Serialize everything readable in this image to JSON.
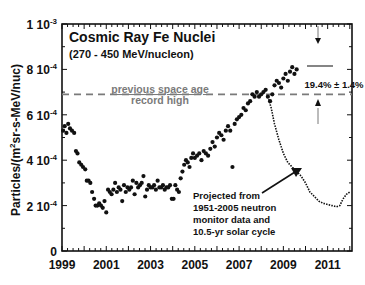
{
  "chart_data": {
    "type": "scatter",
    "title": "Cosmic Ray Fe Nuclei",
    "subtitle": "(270 - 450 MeV/nucleon)",
    "xlabel": "",
    "ylabel": "Particles/(m2sr-s-MeV/nuc)",
    "ylabel_parts": {
      "prefix": "Particles/(m",
      "sup": "2",
      "suffix": "sr-s-MeV/nuc)"
    },
    "xlim": [
      1999,
      2012.1
    ],
    "ylim": [
      0,
      0.001
    ],
    "x_ticks": [
      "1999",
      "2001",
      "2003",
      "2005",
      "2007",
      "2009",
      "2011"
    ],
    "y_ticks": [
      {
        "mant": "0",
        "exp": "",
        "value": 0
      },
      {
        "mant": "2 10",
        "exp": "-4",
        "value": 2
      },
      {
        "mant": "4 10",
        "exp": "-4",
        "value": 4
      },
      {
        "mant": "6 10",
        "exp": "-4",
        "value": 6
      },
      {
        "mant": "8 10",
        "exp": "-4",
        "value": 8
      },
      {
        "mant": "1 10",
        "exp": "-3",
        "value": 10
      }
    ],
    "grid": false,
    "series": [
      {
        "name": "Measured Fe flux (units 1e-4)",
        "style": "dots",
        "x": [
          1999.05,
          1999.12,
          1999.2,
          1999.28,
          1999.36,
          1999.45,
          1999.55,
          1999.63,
          1999.7,
          1999.78,
          1999.87,
          1999.95,
          2000.05,
          2000.12,
          2000.2,
          2000.28,
          2000.36,
          2000.45,
          2000.52,
          2000.6,
          2000.68,
          2000.76,
          2000.84,
          2000.92,
          2001.0,
          2001.08,
          2001.16,
          2001.24,
          2001.32,
          2001.4,
          2001.48,
          2001.56,
          2001.64,
          2001.72,
          2001.8,
          2001.88,
          2001.96,
          2002.04,
          2002.12,
          2002.2,
          2002.28,
          2002.36,
          2002.44,
          2002.52,
          2002.6,
          2002.68,
          2002.76,
          2002.84,
          2002.92,
          2003.0,
          2003.08,
          2003.16,
          2003.24,
          2003.32,
          2003.4,
          2003.48,
          2003.56,
          2003.64,
          2003.72,
          2003.8,
          2003.88,
          2003.96,
          2004.04,
          2004.12,
          2004.2,
          2004.28,
          2004.36,
          2004.44,
          2004.52,
          2004.6,
          2004.68,
          2004.76,
          2004.84,
          2004.92,
          2005.0,
          2005.1,
          2005.2,
          2005.3,
          2005.4,
          2005.5,
          2005.6,
          2005.7,
          2005.8,
          2005.9,
          2006.0,
          2006.1,
          2006.2,
          2006.3,
          2006.4,
          2006.5,
          2006.6,
          2006.7,
          2006.8,
          2006.9,
          2007.0,
          2007.1,
          2007.2,
          2007.3,
          2007.4,
          2007.5,
          2007.6,
          2007.7,
          2007.8,
          2007.9,
          2008.0,
          2008.1,
          2008.2,
          2008.3,
          2008.4,
          2008.5,
          2008.6,
          2008.7,
          2008.8,
          2008.9,
          2009.0,
          2009.1,
          2009.2,
          2009.3,
          2009.4,
          2009.5,
          2009.6
        ],
        "y": [
          5.3,
          5.5,
          5.2,
          5.6,
          5.4,
          5.3,
          5.2,
          4.4,
          4.3,
          3.9,
          3.8,
          3.7,
          3.6,
          3.1,
          3.1,
          3.0,
          2.6,
          2.3,
          2.0,
          2.0,
          2.1,
          2.0,
          1.9,
          2.2,
          1.7,
          2.7,
          2.6,
          2.5,
          2.7,
          3.0,
          2.6,
          2.8,
          2.7,
          2.2,
          2.9,
          2.6,
          2.8,
          2.7,
          2.8,
          3.1,
          2.5,
          3.0,
          2.8,
          2.9,
          3.0,
          3.3,
          2.4,
          2.7,
          2.9,
          2.8,
          2.8,
          2.9,
          2.7,
          3.1,
          2.8,
          2.8,
          2.9,
          2.7,
          2.8,
          2.8,
          2.9,
          2.3,
          2.3,
          2.9,
          2.7,
          2.6,
          3.2,
          3.5,
          3.8,
          4.0,
          3.9,
          3.7,
          4.1,
          4.3,
          4.1,
          4.2,
          4.3,
          4.0,
          4.4,
          4.3,
          4.2,
          4.5,
          4.8,
          4.6,
          5.0,
          5.2,
          5.1,
          4.9,
          5.3,
          5.5,
          5.3,
          3.7,
          5.6,
          5.8,
          5.9,
          6.0,
          6.3,
          6.2,
          6.5,
          6.6,
          6.9,
          6.8,
          7.0,
          6.8,
          6.9,
          7.0,
          7.1,
          6.8,
          6.6,
          6.9,
          7.3,
          7.5,
          7.4,
          7.2,
          7.6,
          7.8,
          7.5,
          7.9,
          8.1,
          7.8,
          8.0
        ]
      },
      {
        "name": "Projected from 1951-2005 neutron monitor data and 10.5-yr solar cycle (units 1e-4)",
        "style": "dotted-line",
        "x": [
          2008.3,
          2008.45,
          2008.6,
          2008.8,
          2009.0,
          2009.2,
          2009.4,
          2009.6,
          2009.8,
          2010.0,
          2010.2,
          2010.4,
          2010.6,
          2010.8,
          2011.0,
          2011.2,
          2011.4,
          2011.55,
          2011.7,
          2011.85,
          2012.0
        ],
        "y": [
          6.8,
          6.3,
          5.6,
          4.9,
          4.3,
          3.9,
          3.7,
          3.5,
          3.3,
          3.0,
          2.6,
          2.4,
          2.2,
          2.1,
          2.05,
          2.0,
          1.95,
          2.0,
          2.3,
          2.5,
          2.6
        ]
      }
    ],
    "reference_line": {
      "value": 6.9,
      "label_line1": "previous space age",
      "label_line2": "record high",
      "color": "#7a7a7a",
      "style": "dashed"
    },
    "annotations": [
      {
        "text": "19.4% ± 1.4%",
        "type": "increase-bracket",
        "top_value": 7.8,
        "bottom_value": 6.9
      },
      {
        "lines": [
          "Projected from",
          "1951-2005 neutron",
          "monitor data and",
          "10.5-yr solar cycle"
        ],
        "type": "arrow-callout",
        "arrow_to": [
          2009.5,
          4.0
        ]
      }
    ],
    "legend": "none"
  }
}
